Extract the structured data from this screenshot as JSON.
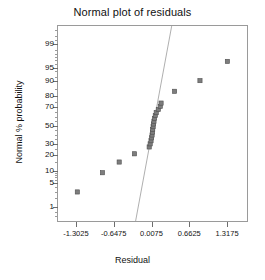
{
  "chart_data": {
    "type": "scatter",
    "title": "Normal plot of residuals",
    "xlabel": "Residual",
    "ylabel": "Normal % probability",
    "grid": false,
    "legend": null,
    "xlim": [
      -1.63,
      1.645
    ],
    "ylim_percent": [
      0.35,
      99.8
    ],
    "xticks": [
      -1.3025,
      -0.6475,
      0.0075,
      0.6625,
      1.3175
    ],
    "xtick_labels": [
      "-1.3025",
      "-0.6475",
      "0.0075",
      "0.6625",
      "1.3175"
    ],
    "yticks": [
      1,
      5,
      10,
      20,
      30,
      50,
      70,
      80,
      90,
      95,
      99
    ],
    "ytick_labels": [
      "1",
      "5",
      "10",
      "20",
      "30",
      "50",
      "70",
      "80",
      "90",
      "95",
      "99"
    ],
    "y_scale": "normal-probability",
    "marker": {
      "shape": "square",
      "size": 4.2,
      "color": "#7d7d7d",
      "edge_color": "#4f4f4f"
    },
    "reference_line": {
      "color": "#9a9a9a",
      "width": 0.8,
      "x_start": -0.285,
      "y_start_percent": 0.35,
      "x_end": 0.34,
      "y_end_percent": 99.8
    },
    "points": [
      {
        "x": -1.295,
        "y": 3.1
      },
      {
        "x": -0.86,
        "y": 9.4
      },
      {
        "x": -0.57,
        "y": 15.6
      },
      {
        "x": -0.305,
        "y": 21.9
      },
      {
        "x": -0.05,
        "y": 28.1
      },
      {
        "x": -0.033,
        "y": 31.2
      },
      {
        "x": -0.018,
        "y": 34.4
      },
      {
        "x": -0.009,
        "y": 37.5
      },
      {
        "x": 0.0,
        "y": 40.6
      },
      {
        "x": 0.006,
        "y": 43.8
      },
      {
        "x": 0.011,
        "y": 46.9
      },
      {
        "x": 0.018,
        "y": 50.0
      },
      {
        "x": 0.024,
        "y": 53.1
      },
      {
        "x": 0.033,
        "y": 56.2
      },
      {
        "x": 0.042,
        "y": 59.4
      },
      {
        "x": 0.056,
        "y": 62.5
      },
      {
        "x": 0.072,
        "y": 65.6
      },
      {
        "x": 0.108,
        "y": 68.8
      },
      {
        "x": 0.142,
        "y": 71.9
      },
      {
        "x": 0.156,
        "y": 75.0
      },
      {
        "x": 0.39,
        "y": 84.4
      },
      {
        "x": 0.83,
        "y": 90.6
      },
      {
        "x": 1.305,
        "y": 96.9
      }
    ]
  }
}
